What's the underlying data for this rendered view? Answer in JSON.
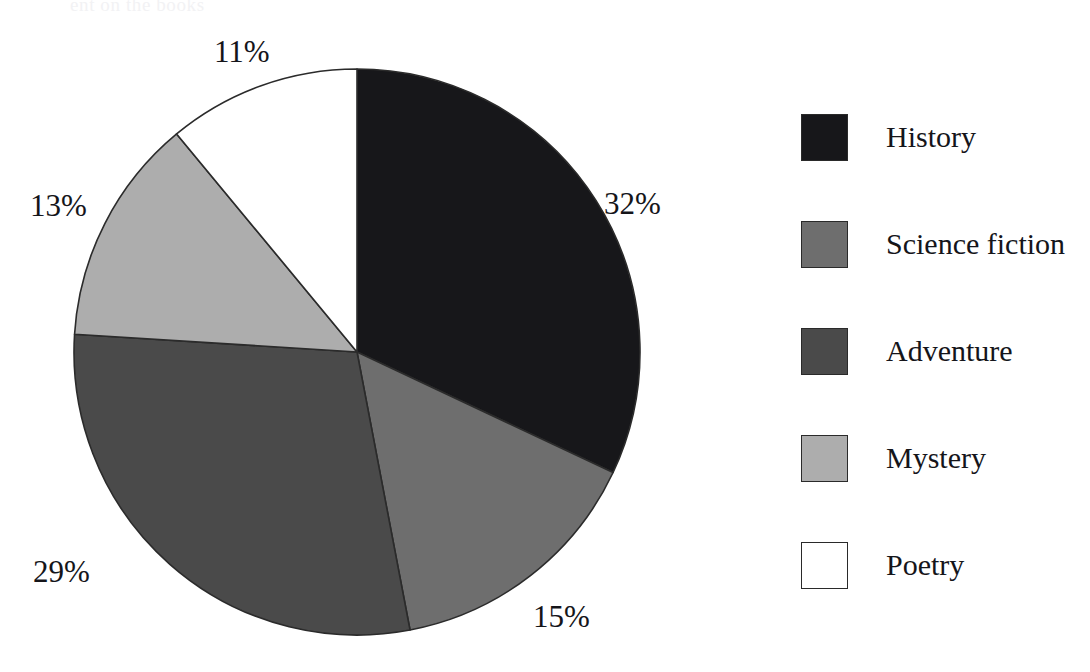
{
  "scan_artifact": {
    "ghost_text": "ent on the books"
  },
  "chart_data": {
    "type": "pie",
    "title": "",
    "subtitle": "",
    "xlabel": "",
    "ylabel": "",
    "legend_position": "right",
    "grid": false,
    "start_angle_deg": 0,
    "direction": "clockwise",
    "units": "percent",
    "categories": [
      "History",
      "Science fiction",
      "Adventure",
      "Mystery",
      "Poetry"
    ],
    "values": [
      32,
      15,
      29,
      13,
      11
    ],
    "value_labels": [
      "32%",
      "15%",
      "29%",
      "13%",
      "11%"
    ],
    "colors": [
      "#17171a",
      "#6e6e6e",
      "#4a4a4a",
      "#adadad",
      "#ffffff"
    ],
    "slice_border_color": "#2b2b2b",
    "slices": [
      {
        "label": "History",
        "value": 32,
        "value_label": "32%",
        "color": "#17171a"
      },
      {
        "label": "Science fiction",
        "value": 15,
        "value_label": "15%",
        "color": "#6e6e6e"
      },
      {
        "label": "Adventure",
        "value": 29,
        "value_label": "29%",
        "color": "#4a4a4a"
      },
      {
        "label": "Mystery",
        "value": 13,
        "value_label": "13%",
        "color": "#adadad"
      },
      {
        "label": "Poetry",
        "value": 11,
        "value_label": "11%",
        "color": "#ffffff"
      }
    ]
  },
  "legend": {
    "items": [
      {
        "label": "History",
        "color": "#17171a"
      },
      {
        "label": "Science fiction",
        "color": "#6e6e6e"
      },
      {
        "label": "Adventure",
        "color": "#4a4a4a"
      },
      {
        "label": "Mystery",
        "color": "#adadad"
      },
      {
        "label": "Poetry",
        "color": "#ffffff"
      }
    ]
  }
}
